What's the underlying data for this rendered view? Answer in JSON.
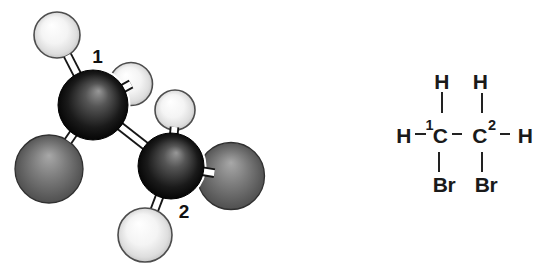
{
  "model": {
    "carbon1_label": "1",
    "carbon2_label": "2",
    "colors": {
      "hydrogen_center": "#ffffff",
      "hydrogen_mid": "#f4f4f4",
      "hydrogen_shade": "#dedede",
      "hydrogen_edge": "#c4c4c4",
      "hydrogen_outline": "#4d4d4d",
      "carbon_highlight": "#989898",
      "carbon_mid": "#555555",
      "carbon_shade": "#1a1a1a",
      "carbon_edge": "#000000",
      "carbon_outline": "#000000",
      "bromine_highlight": "#a8a8a8",
      "bromine_mid": "#7c7c7c",
      "bromine_shade": "#575757",
      "bromine_edge": "#4b4b4b",
      "bromine_outline": "#303030",
      "bond_outline": "#161616",
      "bond_fill": "#ffffff",
      "label_color": "#111111"
    }
  },
  "formula": {
    "top_left_h": "H",
    "top_right_h": "H",
    "left_h": "H",
    "carbon1": "C",
    "carbon1_superscript": "1",
    "carbon2": "C",
    "carbon2_superscript": "2",
    "right_h": "H",
    "left_br": "Br",
    "right_br": "Br"
  }
}
